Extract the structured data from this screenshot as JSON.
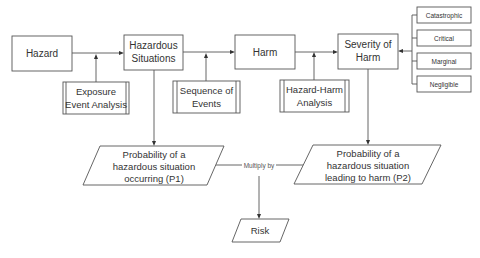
{
  "diagram": {
    "main_nodes": {
      "hazard": "Hazard",
      "hazardous_situations": [
        "Hazardous",
        "Situations"
      ],
      "harm": "Harm",
      "severity_of_harm": [
        "Severity of",
        "Harm"
      ]
    },
    "analysis_nodes": {
      "exposure": [
        "Exposure",
        "Event Analysis"
      ],
      "sequence": [
        "Sequence of",
        "Events"
      ],
      "hazard_harm": [
        "Hazard-Harm",
        "Analysis"
      ]
    },
    "severity_levels": [
      "Catastrophic",
      "Critical",
      "Marginal",
      "Negligible"
    ],
    "probability_nodes": {
      "p1": [
        "Probability of a",
        "hazardous situation",
        "occurring (P1)"
      ],
      "p2": [
        "Probability of a",
        "hazardous situation",
        "leading to harm (P2)"
      ]
    },
    "operator_label": "Multiply by",
    "result": "Risk",
    "colors": {
      "stroke": "#555555",
      "text": "#333333",
      "background": "#ffffff"
    }
  }
}
